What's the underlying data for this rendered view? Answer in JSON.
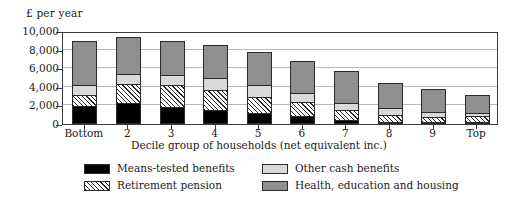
{
  "chart_data": {
    "type": "bar",
    "subtype": "stacked-vertical",
    "title": "",
    "ylabel": "£ per year",
    "xlabel": "Decile group of households (net equivalent inc.)",
    "ylim": [
      0,
      10000
    ],
    "ytick_values": [
      0,
      2000,
      4000,
      6000,
      8000,
      10000
    ],
    "ytick_labels": [
      "0",
      "2,000",
      "4,000",
      "6,000",
      "8,000",
      "10,000"
    ],
    "grid": true,
    "grid_axis": "y",
    "legend_position": "bottom",
    "legend_columns": 2,
    "categories": [
      "Bottom",
      "2",
      "3",
      "4",
      "5",
      "6",
      "7",
      "8",
      "9",
      "Top"
    ],
    "series": [
      {
        "name": "Means-tested benefits",
        "color": "#000000",
        "pattern": "solid-black",
        "values": [
          1900,
          2250,
          1800,
          1500,
          1150,
          900,
          450,
          250,
          150,
          100
        ]
      },
      {
        "name": "Retirement pension",
        "color": "#ffffff",
        "pattern": "diagonal-hatch",
        "values": [
          1200,
          2100,
          2400,
          2150,
          1750,
          1500,
          1050,
          700,
          550,
          600
        ]
      },
      {
        "name": "Other cash benefits",
        "color": "#d9d9d9",
        "pattern": "light-grey",
        "values": [
          1100,
          1050,
          1050,
          1350,
          1300,
          950,
          800,
          800,
          550,
          350
        ]
      },
      {
        "name": "Health, education and housing",
        "color": "#8f8f8f",
        "pattern": "mid-grey",
        "values": [
          4700,
          3950,
          3650,
          3450,
          3500,
          3450,
          3400,
          2650,
          2450,
          2000
        ]
      }
    ],
    "totals": [
      8900,
      9350,
      8900,
      8450,
      7700,
      6800,
      5700,
      4400,
      3700,
      3050
    ]
  }
}
